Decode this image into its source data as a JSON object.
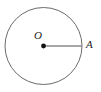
{
  "figure": {
    "kind": "circle-with-radius-diagram",
    "background_color": "#ffffff",
    "stroke_color": "#6b6b6b",
    "line_color": "#8a8a8a",
    "point_color": "#111111",
    "text_color": "#1b1b1b",
    "circle": {
      "name": "circle-outline",
      "center_x": 43.5,
      "center_y": 46,
      "radius": 38.5,
      "stroke_width": 1
    },
    "center_point": {
      "name": "center-point-o",
      "x": 43.5,
      "y": 46,
      "dot_radius": 2.4,
      "label": "O",
      "label_x": 34,
      "label_y": 30
    },
    "radius_segment": {
      "name": "radius-segment-oa",
      "x1": 43.5,
      "y1": 46,
      "x2": 82,
      "y2": 46,
      "stroke_width": 1.6
    },
    "point_a": {
      "name": "point-a-on-circumference",
      "x": 82,
      "y": 46,
      "label": "A",
      "label_x": 86,
      "label_y": 39
    }
  }
}
